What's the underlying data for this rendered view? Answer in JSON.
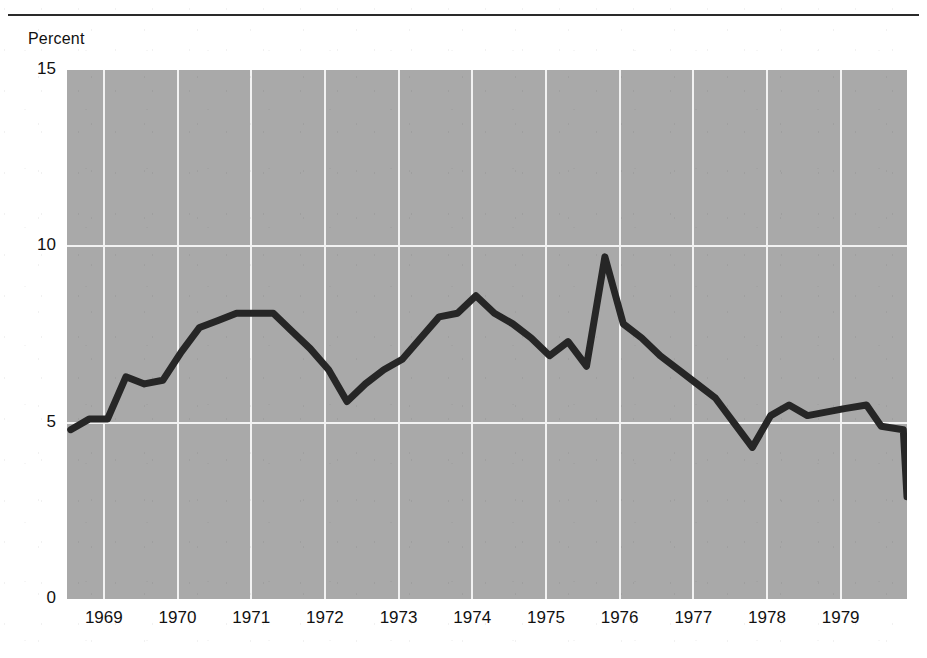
{
  "figure": {
    "y_axis_unit_label": "Percent",
    "background_color": "#a9a9a9",
    "line_color": "#262626",
    "grid_color": "#f2f2f2",
    "rule_color": "#2a2a2a"
  },
  "chart_data": {
    "type": "line",
    "title": "",
    "subtitle": "",
    "xlabel": "",
    "ylabel": "Percent",
    "ylim": [
      0,
      15
    ],
    "yticks": [
      0,
      5,
      10,
      15
    ],
    "ytick_labels": [
      "0",
      "5",
      "10",
      "15"
    ],
    "xlim": [
      1968.5,
      1979.9
    ],
    "xticks": [
      1969,
      1970,
      1971,
      1972,
      1973,
      1974,
      1975,
      1976,
      1977,
      1978,
      1979
    ],
    "xtick_labels": [
      "1969",
      "1970",
      "1971",
      "1972",
      "1973",
      "1974",
      "1975",
      "1976",
      "1977",
      "1978",
      "1979"
    ],
    "grid": "horizontal-and-vertical",
    "legend": "none",
    "series": [
      {
        "name": "Percent",
        "x": [
          1968.55,
          1968.8,
          1969.05,
          1969.3,
          1969.55,
          1969.8,
          1970.05,
          1970.3,
          1970.55,
          1970.8,
          1971.05,
          1971.3,
          1971.55,
          1971.8,
          1972.05,
          1972.3,
          1972.55,
          1972.8,
          1973.05,
          1973.3,
          1973.55,
          1973.8,
          1974.05,
          1974.3,
          1974.55,
          1974.8,
          1975.05,
          1975.3,
          1975.55,
          1975.8,
          1976.05,
          1976.3,
          1976.55,
          1976.8,
          1977.05,
          1977.3,
          1977.55,
          1977.8,
          1978.05,
          1978.3,
          1978.55,
          1978.8,
          1979.05,
          1979.55,
          1979.85
        ],
        "y": [
          4.8,
          5.1,
          5.1,
          6.3,
          6.1,
          6.2,
          7.0,
          7.7,
          7.9,
          8.1,
          8.1,
          8.1,
          7.6,
          7.1,
          6.5,
          5.6,
          6.1,
          6.5,
          6.8,
          7.4,
          8.0,
          8.1,
          8.6,
          8.1,
          7.8,
          7.4,
          6.9,
          7.3,
          6.6,
          9.7,
          7.8,
          7.4,
          6.9,
          6.5,
          6.1,
          5.7,
          5.0,
          4.3,
          5.2,
          5.5,
          5.2,
          5.3,
          5.4,
          4.9,
          4.8
        ],
        "y_extra": [
          5.5,
          2.9
        ],
        "x_extra": [
          1979.35,
          1979.9
        ]
      }
    ],
    "annotations": []
  }
}
